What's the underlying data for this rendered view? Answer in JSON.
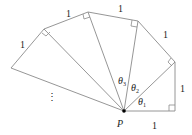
{
  "diagram": {
    "center_point": {
      "label": "P",
      "x": 124,
      "y": 111
    },
    "outer_vertices": [
      {
        "x": 175,
        "y": 111
      },
      {
        "x": 175,
        "y": 62
      },
      {
        "x": 138,
        "y": 21
      },
      {
        "x": 88,
        "y": 12
      },
      {
        "x": 44,
        "y": 29
      },
      {
        "x": 11,
        "y": 68
      }
    ],
    "edge_labels": [
      {
        "text": "1",
        "x": 155,
        "y": 129
      },
      {
        "text": "1",
        "x": 181,
        "y": 90
      },
      {
        "text": "1",
        "x": 163,
        "y": 36
      },
      {
        "text": "1",
        "x": 119,
        "y": 11
      },
      {
        "text": "1",
        "x": 69,
        "y": 14
      },
      {
        "text": "1",
        "x": 22,
        "y": 46
      }
    ],
    "angle_labels": [
      {
        "text": "θ",
        "sub": "1",
        "x": 138,
        "y": 104
      },
      {
        "text": "θ",
        "sub": "2",
        "x": 133,
        "y": 89
      },
      {
        "text": "θ",
        "sub": "3",
        "x": 118,
        "y": 83
      }
    ],
    "continuation": {
      "text": "⋮",
      "x": 49,
      "y": 98
    },
    "colors": {
      "line": "#8a8a8a",
      "text": "#222222",
      "point": "#000000"
    }
  }
}
